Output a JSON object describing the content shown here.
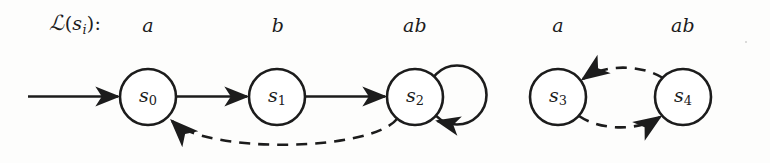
{
  "figure": {
    "kind": "labeled-transition-system",
    "width": 770,
    "height": 163,
    "background_color": "#fdfdfc",
    "stroke_color": "#1c1c1c",
    "caption": {
      "script_l": "ℒ",
      "open_paren": "(",
      "s": "s",
      "sub": "i",
      "close_paren": ")",
      "colon": ":",
      "full_text": "ℒ(sᵢ):"
    },
    "atomic_proposition_labels": [
      {
        "id": "ap-s0",
        "text": "a",
        "x": 148,
        "y": 25
      },
      {
        "id": "ap-s1",
        "text": "b",
        "x": 278,
        "y": 25
      },
      {
        "id": "ap-s2",
        "text": "ab",
        "x": 415,
        "y": 25
      },
      {
        "id": "ap-s3",
        "text": "a",
        "x": 558,
        "y": 25
      },
      {
        "id": "ap-s4",
        "text": "ab",
        "x": 683,
        "y": 25
      }
    ],
    "states": [
      {
        "id": "s0",
        "s": "s",
        "index": "0",
        "cx": 148,
        "cy": 97,
        "r": 28
      },
      {
        "id": "s1",
        "s": "s",
        "index": "1",
        "cx": 277,
        "cy": 97,
        "r": 28
      },
      {
        "id": "s2",
        "s": "s",
        "index": "2",
        "cx": 415,
        "cy": 97,
        "r": 28
      },
      {
        "id": "s3",
        "s": "s",
        "index": "3",
        "cx": 558,
        "cy": 97,
        "r": 28
      },
      {
        "id": "s4",
        "s": "s",
        "index": "4",
        "cx": 683,
        "cy": 97,
        "r": 28
      }
    ],
    "transitions": [
      {
        "id": "initial-arrow",
        "from": null,
        "to": "s0",
        "style": "solid",
        "shape": "straight"
      },
      {
        "id": "t-s0-s1",
        "from": "s0",
        "to": "s1",
        "style": "solid",
        "shape": "straight"
      },
      {
        "id": "t-s1-s2",
        "from": "s1",
        "to": "s2",
        "style": "solid",
        "shape": "straight"
      },
      {
        "id": "t-s2-s2",
        "from": "s2",
        "to": "s2",
        "style": "solid",
        "shape": "self-loop"
      },
      {
        "id": "t-s2-s0",
        "from": "s2",
        "to": "s0",
        "style": "dashed",
        "shape": "curve-below"
      },
      {
        "id": "t-s4-s3",
        "from": "s4",
        "to": "s3",
        "style": "dashed",
        "shape": "curve-above"
      },
      {
        "id": "t-s3-s4",
        "from": "s3",
        "to": "s4",
        "style": "dashed",
        "shape": "curve-below"
      }
    ]
  }
}
